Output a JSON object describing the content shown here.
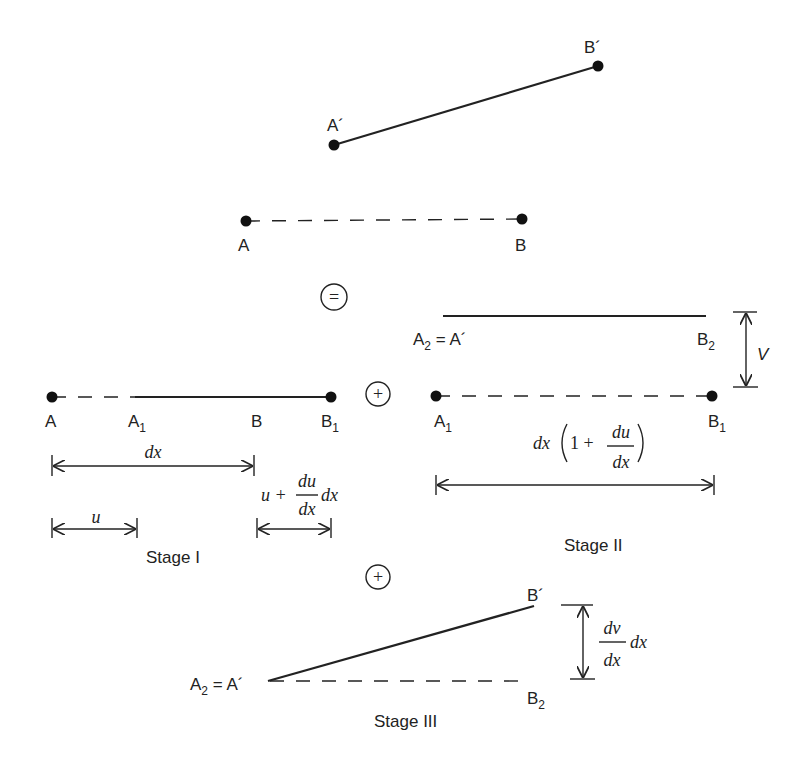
{
  "diagram": {
    "original": {
      "segment": {
        "from": "A",
        "to": "B",
        "style": "dashed"
      },
      "labels": {
        "A": "A",
        "B": "B"
      },
      "points": {
        "A": [
          246,
          221
        ],
        "B": [
          522,
          219
        ]
      }
    },
    "deformed": {
      "segment": {
        "from": "A´",
        "to": "B´",
        "style": "solid"
      },
      "labels": {
        "A": "A´",
        "B": "B´"
      },
      "points": {
        "A": [
          334,
          145
        ],
        "B": [
          598,
          66
        ]
      }
    },
    "operators": {
      "equals": "=",
      "plus1": "+",
      "plus2": "+"
    },
    "stage1": {
      "caption": "Stage I",
      "labels": {
        "A": "A",
        "A1": "A",
        "A1_sub": "1",
        "B": "B",
        "B1": "B",
        "B1_sub": "1"
      },
      "dims": {
        "dx": "dx",
        "u": "u",
        "u_plus": "u +",
        "du_num": "du",
        "du_den": "dx",
        "du_tail": "dx"
      }
    },
    "stage2": {
      "caption": "Stage II",
      "labels": {
        "A2eq": "A",
        "A2eq_sub": "2",
        "A2eq_rest": " = A´",
        "B2": "B",
        "B2_sub": "2",
        "A1": "A",
        "A1_sub": "1",
        "B1": "B",
        "B1_sub": "1",
        "V": "V"
      },
      "dims": {
        "dx_pre": "dx",
        "one_plus": "1 +",
        "num": "du",
        "den": "dx"
      }
    },
    "stage3": {
      "caption": "Stage III",
      "labels": {
        "A2eq": "A",
        "A2eq_sub": "2",
        "A2eq_rest": " = A´",
        "Bp": "B´",
        "B2": "B",
        "B2_sub": "2"
      },
      "dims": {
        "num": "dv",
        "den": "dx",
        "tail": "dx"
      }
    }
  }
}
